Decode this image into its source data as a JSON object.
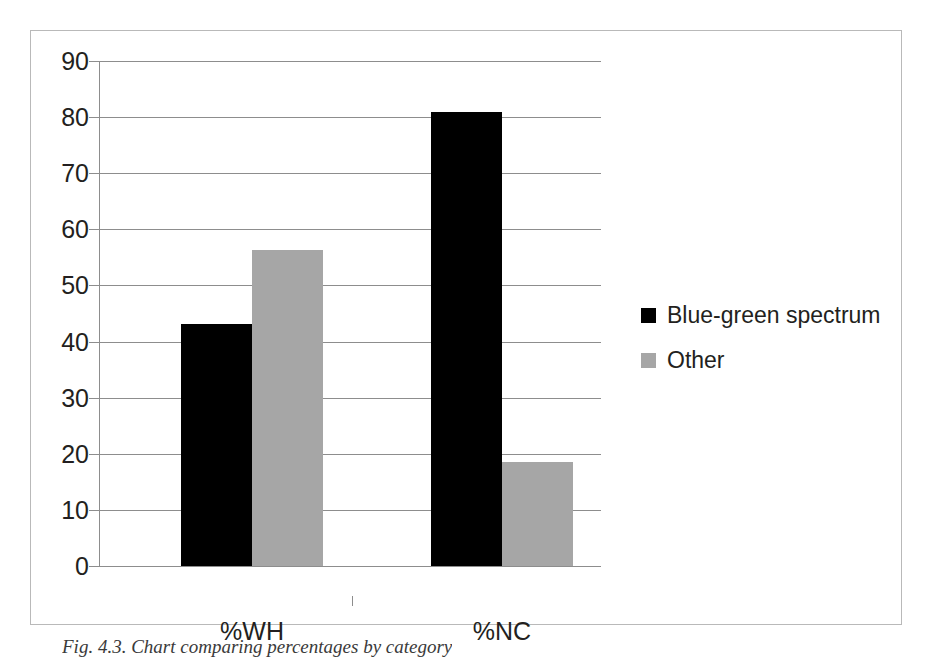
{
  "chart_data": {
    "type": "bar",
    "title": "",
    "xlabel": "",
    "ylabel": "",
    "categories": [
      "%WH",
      "%NC"
    ],
    "series": [
      {
        "name": "Blue-green spectrum",
        "color": "#000000",
        "values": [
          43.2,
          81.0
        ]
      },
      {
        "name": "Other",
        "color": "#a6a6a6",
        "values": [
          56.4,
          18.6
        ]
      }
    ],
    "ylim": [
      0,
      90
    ],
    "ytick_labels": [
      "90",
      "80",
      "70",
      "60",
      "50",
      "40",
      "30",
      "20",
      "10",
      "0"
    ],
    "ytick_values": [
      90,
      80,
      70,
      60,
      50,
      40,
      30,
      20,
      10,
      0
    ],
    "grid": true,
    "legend_position": "right"
  },
  "legend": {
    "entries": [
      {
        "label": "Blue-green spectrum",
        "swatch": "#000000"
      },
      {
        "label": "Other",
        "swatch": "#a6a6a6"
      }
    ]
  },
  "caption": {
    "text": "Fig. 4.3. Chart comparing percentages by category"
  },
  "colors": {
    "series_a": "#000000",
    "series_b": "#a6a6a6",
    "axis": "#8d8d8d",
    "frame": "#b9b9b9",
    "text": "#231f20",
    "background": "#ffffff"
  }
}
